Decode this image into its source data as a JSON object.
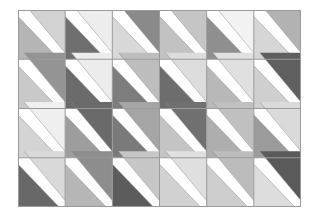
{
  "figure": {
    "rows": 4,
    "columns": 6,
    "origin_x": 18,
    "origin_y": 10,
    "width": 283,
    "height": 197,
    "cell_width": 47.1,
    "cell_height": 49.2,
    "background_color": "#ffffff",
    "border_color": "#9a9a9a",
    "grid_line_color": "#9a9a9a",
    "border_width": 1,
    "grid_line_width": 1,
    "diagonal_direction": "top-left-to-bottom-right",
    "band_color": "#ffffff",
    "palette": {
      "white": "#ffffff",
      "very-light-gray": "#ededed",
      "light-gray": "#dcdcdc",
      "light-medium-gray": "#c8c8c8",
      "medium-gray": "#b0b0b0",
      "medium-dark-gray": "#919191",
      "dark-gray": "#6e6e6e",
      "very-dark-gray": "#595959"
    },
    "cells": [
      [
        {
          "row": 1,
          "col": 1,
          "upper": "#d2d2d2",
          "lower": "#b5b5b5"
        },
        {
          "row": 1,
          "col": 2,
          "upper": "#ededed",
          "lower": "#6f6f6f"
        },
        {
          "row": 1,
          "col": 3,
          "upper": "#8a8a8a",
          "lower": "#d8d8d8"
        },
        {
          "row": 1,
          "col": 4,
          "upper": "#c5c5c5",
          "lower": "#c2c2c2"
        },
        {
          "row": 1,
          "col": 5,
          "upper": "#f2f2f2",
          "lower": "#8f8f8f"
        },
        {
          "row": 1,
          "col": 6,
          "upper": "#b2b2b2",
          "lower": "#d6d6d6"
        }
      ],
      [
        {
          "row": 2,
          "col": 1,
          "upper": "#949494",
          "lower": "#c9c9c9"
        },
        {
          "row": 2,
          "col": 2,
          "upper": "#ececec",
          "lower": "#6b6b6b"
        },
        {
          "row": 2,
          "col": 3,
          "upper": "#bdbdbd",
          "lower": "#7d7d7d"
        },
        {
          "row": 2,
          "col": 4,
          "upper": "#dcdcdc",
          "lower": "#6d6d6d"
        },
        {
          "row": 2,
          "col": 5,
          "upper": "#e0e0e0",
          "lower": "#b8b8b8"
        },
        {
          "row": 2,
          "col": 6,
          "upper": "#5f5f5f",
          "lower": "#cfcfcf"
        }
      ],
      [
        {
          "row": 3,
          "col": 1,
          "upper": "#efefef",
          "lower": "#d4d4d4"
        },
        {
          "row": 3,
          "col": 2,
          "upper": "#6a6a6a",
          "lower": "#9d9d9d"
        },
        {
          "row": 3,
          "col": 3,
          "upper": "#a5a5a5",
          "lower": "#7a7a7a"
        },
        {
          "row": 3,
          "col": 4,
          "upper": "#707070",
          "lower": "#c4c4c4"
        },
        {
          "row": 3,
          "col": 5,
          "upper": "#c0c0c0",
          "lower": "#aeaeae"
        },
        {
          "row": 3,
          "col": 6,
          "upper": "#dadada",
          "lower": "#9b9b9b"
        }
      ],
      [
        {
          "row": 4,
          "col": 1,
          "upper": "#d9d9d9",
          "lower": "#686868"
        },
        {
          "row": 4,
          "col": 2,
          "upper": "#8d8d8d",
          "lower": "#b6b6b6"
        },
        {
          "row": 4,
          "col": 3,
          "upper": "#c6c6c6",
          "lower": "#5c5c5c"
        },
        {
          "row": 4,
          "col": 4,
          "upper": "#dfdfdf",
          "lower": "#d1d1d1"
        },
        {
          "row": 4,
          "col": 5,
          "upper": "#bcbcbc",
          "lower": "#cdcdcd"
        },
        {
          "row": 4,
          "col": 6,
          "upper": "#5a5a5a",
          "lower": "#dddddd"
        }
      ]
    ]
  }
}
